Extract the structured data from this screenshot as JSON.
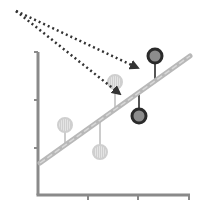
{
  "diagram": {
    "type": "regression-residuals",
    "colors": {
      "axis": "#8a8a8a",
      "regression_line": "#b8b8b8",
      "light_point_fill": "#dedede",
      "light_point_stroke": "#cfcfcf",
      "dark_point_fill": "#8c8c8c",
      "dark_point_stroke": "#2a2a2a",
      "residual_light": "#cccccc",
      "residual_dark": "#555555",
      "arrow": "#333333"
    },
    "axes": {
      "origin": [
        38,
        195
      ],
      "y_top": 52,
      "x_right": 190,
      "y_ticks": [
        100,
        148
      ],
      "x_ticks": [
        88,
        138,
        189
      ]
    },
    "regression_line": {
      "x1": 40,
      "y1": 163,
      "x2": 190,
      "y2": 56
    },
    "points": [
      {
        "kind": "light",
        "cx": 65,
        "cy": 125,
        "line_y": 145
      },
      {
        "kind": "light",
        "cx": 100,
        "cy": 152,
        "line_y": 120
      },
      {
        "kind": "light",
        "cx": 115,
        "cy": 82,
        "line_y": 108
      },
      {
        "kind": "dark",
        "cx": 155,
        "cy": 56,
        "line_y": 80
      },
      {
        "kind": "dark",
        "cx": 139,
        "cy": 116,
        "line_y": 95
      }
    ],
    "arrows": [
      {
        "x1": 16,
        "y1": 11,
        "x2": 138,
        "y2": 68
      },
      {
        "x1": 16,
        "y1": 11,
        "x2": 120,
        "y2": 94
      }
    ]
  }
}
